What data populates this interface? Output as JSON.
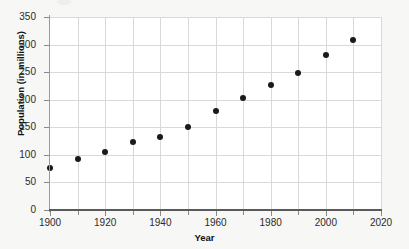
{
  "chart_data": {
    "type": "scatter",
    "title": "",
    "xlabel": "Year",
    "ylabel": "Population (in millions)",
    "x": [
      1900,
      1910,
      1920,
      1930,
      1940,
      1950,
      1960,
      1970,
      1980,
      1990,
      2000,
      2010
    ],
    "values": [
      76,
      92,
      106,
      123,
      132,
      151,
      179,
      203,
      227,
      249,
      281,
      309
    ],
    "series": [
      {
        "name": "Population",
        "values": [
          76,
          92,
          106,
          123,
          132,
          151,
          179,
          203,
          227,
          249,
          281,
          309
        ]
      }
    ],
    "xlim": [
      1900,
      2020
    ],
    "ylim": [
      0,
      350
    ],
    "x_ticks": [
      1900,
      1920,
      1940,
      1960,
      1980,
      2000,
      2020
    ],
    "x_ticks_labels": [
      "1900",
      "1920",
      "1940",
      "1960",
      "1980",
      "2000",
      "2020"
    ],
    "x_minor_ticks": [
      1910,
      1930,
      1950,
      1970,
      1990,
      2010
    ],
    "y_ticks": [
      0,
      50,
      100,
      150,
      200,
      250,
      300,
      350
    ],
    "y_ticks_labels": [
      "0",
      "50",
      "100",
      "150",
      "200",
      "250",
      "300",
      "350"
    ],
    "grid": true,
    "grid_axis": "both",
    "legend": false,
    "legend_position": "none",
    "marker": "circle",
    "marker_color": "#1a1a1a",
    "plot_background": "#ffffff",
    "figure_background": "#f7f7f5",
    "gridline_color": "#d9d9d9",
    "axis_color": "#5a5a5a"
  }
}
